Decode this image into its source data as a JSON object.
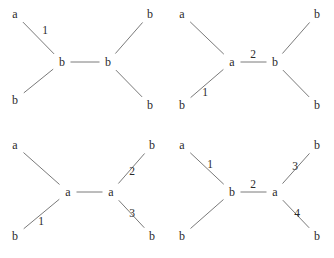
{
  "figure": {
    "width": 334,
    "height": 258,
    "background_color": "#ffffff",
    "line_color": "#7a7a7a",
    "text_color": "#2b2b2b",
    "layout": "2x2 grid of tree diagrams"
  },
  "panels": [
    {
      "id": "panel-1",
      "position": "top-left",
      "origin": {
        "x": 0,
        "y": 0
      },
      "nodes": [
        {
          "id": "p1-n1",
          "label": "a",
          "x": 15,
          "y": 14,
          "role": "leaf"
        },
        {
          "id": "p1-n2",
          "label": "b",
          "x": 15,
          "y": 100,
          "role": "leaf"
        },
        {
          "id": "p1-n3",
          "label": "b",
          "x": 62,
          "y": 62,
          "role": "internal"
        },
        {
          "id": "p1-n4",
          "label": "b",
          "x": 108,
          "y": 62,
          "role": "internal"
        },
        {
          "id": "p1-n5",
          "label": "b",
          "x": 150,
          "y": 14,
          "role": "leaf"
        },
        {
          "id": "p1-n6",
          "label": "b",
          "x": 150,
          "y": 105,
          "role": "leaf"
        }
      ],
      "edges": [
        {
          "from": "p1-n1",
          "to": "p1-n3",
          "label": "1"
        },
        {
          "from": "p1-n2",
          "to": "p1-n3",
          "label": ""
        },
        {
          "from": "p1-n3",
          "to": "p1-n4",
          "label": ""
        },
        {
          "from": "p1-n4",
          "to": "p1-n5",
          "label": ""
        },
        {
          "from": "p1-n4",
          "to": "p1-n6",
          "label": ""
        }
      ],
      "edge_labels": [
        {
          "text": "1",
          "x": 45,
          "y": 31
        }
      ]
    },
    {
      "id": "panel-2",
      "position": "top-right",
      "origin": {
        "x": 167,
        "y": 0
      },
      "nodes": [
        {
          "id": "p2-n1",
          "label": "a",
          "x": 15,
          "y": 14,
          "role": "leaf"
        },
        {
          "id": "p2-n2",
          "label": "b",
          "x": 15,
          "y": 105,
          "role": "leaf"
        },
        {
          "id": "p2-n3",
          "label": "a",
          "x": 65,
          "y": 62,
          "role": "internal"
        },
        {
          "id": "p2-n4",
          "label": "b",
          "x": 108,
          "y": 62,
          "role": "internal"
        },
        {
          "id": "p2-n5",
          "label": "b",
          "x": 150,
          "y": 14,
          "role": "leaf"
        },
        {
          "id": "p2-n6",
          "label": "b",
          "x": 150,
          "y": 105,
          "role": "leaf"
        }
      ],
      "edges": [
        {
          "from": "p2-n1",
          "to": "p2-n3",
          "label": ""
        },
        {
          "from": "p2-n2",
          "to": "p2-n3",
          "label": "1"
        },
        {
          "from": "p2-n3",
          "to": "p2-n4",
          "label": "2"
        },
        {
          "from": "p2-n4",
          "to": "p2-n5",
          "label": ""
        },
        {
          "from": "p2-n4",
          "to": "p2-n6",
          "label": ""
        }
      ],
      "edge_labels": [
        {
          "text": "1",
          "x": 38,
          "y": 93
        },
        {
          "text": "2",
          "x": 86,
          "y": 55
        }
      ]
    },
    {
      "id": "panel-3",
      "position": "bottom-left",
      "origin": {
        "x": 0,
        "y": 129
      },
      "nodes": [
        {
          "id": "p3-n1",
          "label": "a",
          "x": 15,
          "y": 16,
          "role": "leaf"
        },
        {
          "id": "p3-n2",
          "label": "b",
          "x": 15,
          "y": 107,
          "role": "leaf"
        },
        {
          "id": "p3-n3",
          "label": "a",
          "x": 68,
          "y": 63,
          "role": "internal"
        },
        {
          "id": "p3-n4",
          "label": "a",
          "x": 111,
          "y": 63,
          "role": "internal"
        },
        {
          "id": "p3-n5",
          "label": "b",
          "x": 152,
          "y": 16,
          "role": "leaf"
        },
        {
          "id": "p3-n6",
          "label": "b",
          "x": 152,
          "y": 107,
          "role": "leaf"
        }
      ],
      "edges": [
        {
          "from": "p3-n1",
          "to": "p3-n3",
          "label": ""
        },
        {
          "from": "p3-n2",
          "to": "p3-n3",
          "label": "1"
        },
        {
          "from": "p3-n3",
          "to": "p3-n4",
          "label": ""
        },
        {
          "from": "p3-n4",
          "to": "p3-n5",
          "label": "2"
        },
        {
          "from": "p3-n4",
          "to": "p3-n6",
          "label": "3"
        }
      ],
      "edge_labels": [
        {
          "text": "1",
          "x": 41,
          "y": 93
        },
        {
          "text": "2",
          "x": 132,
          "y": 43
        },
        {
          "text": "3",
          "x": 132,
          "y": 85
        }
      ]
    },
    {
      "id": "panel-4",
      "position": "bottom-right",
      "origin": {
        "x": 167,
        "y": 129
      },
      "nodes": [
        {
          "id": "p4-n1",
          "label": "a",
          "x": 15,
          "y": 16,
          "role": "leaf"
        },
        {
          "id": "p4-n2",
          "label": "b",
          "x": 15,
          "y": 107,
          "role": "leaf"
        },
        {
          "id": "p4-n3",
          "label": "b",
          "x": 65,
          "y": 63,
          "role": "internal"
        },
        {
          "id": "p4-n4",
          "label": "a",
          "x": 108,
          "y": 63,
          "role": "internal"
        },
        {
          "id": "p4-n5",
          "label": "b",
          "x": 150,
          "y": 16,
          "role": "leaf"
        },
        {
          "id": "p4-n6",
          "label": "b",
          "x": 150,
          "y": 107,
          "role": "leaf"
        }
      ],
      "edges": [
        {
          "from": "p4-n1",
          "to": "p4-n3",
          "label": "1"
        },
        {
          "from": "p4-n2",
          "to": "p4-n3",
          "label": ""
        },
        {
          "from": "p4-n3",
          "to": "p4-n4",
          "label": "2"
        },
        {
          "from": "p4-n4",
          "to": "p4-n5",
          "label": "3"
        },
        {
          "from": "p4-n4",
          "to": "p4-n6",
          "label": "4"
        }
      ],
      "edge_labels": [
        {
          "text": "1",
          "x": 43,
          "y": 36
        },
        {
          "text": "2",
          "x": 86,
          "y": 56
        },
        {
          "text": "3",
          "x": 128,
          "y": 38
        },
        {
          "text": "4",
          "x": 130,
          "y": 85
        }
      ]
    }
  ]
}
